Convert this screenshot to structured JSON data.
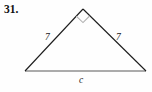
{
  "exercise": {
    "number_label": "31."
  },
  "figure": {
    "type": "right-triangle",
    "right_angle_marker": "square-angle-marker",
    "colors": {
      "leg_stroke": "#1c1c1c",
      "base_stroke": "#8f8f8f",
      "angle_marker_stroke": "#b3b3b3",
      "background": "#fefefe",
      "text": "#111111"
    },
    "vertices": {
      "apex": {
        "x": 83,
        "y": 9
      },
      "bottom_left": {
        "x": 25,
        "y": 71
      },
      "bottom_right": {
        "x": 146,
        "y": 71
      }
    },
    "labels": {
      "left_leg": "7",
      "right_leg": "7",
      "base": "c"
    }
  }
}
